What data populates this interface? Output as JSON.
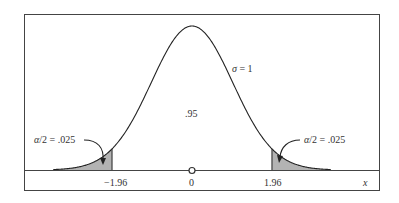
{
  "chart_data": {
    "type": "area",
    "title": "",
    "xlabel": "x",
    "ylabel": "",
    "x_ticks": [
      {
        "value": -1.96,
        "label": "−1.96"
      },
      {
        "value": 0,
        "label": "0"
      },
      {
        "value": 1.96,
        "label": "1.96"
      }
    ],
    "curve": {
      "mean": 0,
      "sigma": 1,
      "x_range": [
        -3.4,
        3.4
      ]
    },
    "shaded_regions": [
      {
        "from": -3.4,
        "to": -1.96,
        "area": 0.025,
        "label": "α/2 = .025"
      },
      {
        "from": 1.96,
        "to": 3.4,
        "area": 0.025,
        "label": "α/2 = .025"
      }
    ],
    "annotations": [
      {
        "text": "σ = 1",
        "position": "right of peak"
      },
      {
        "text": ".95",
        "position": "center under curve"
      },
      {
        "text": "α/2 = .025",
        "position": "left tail, arrow to shaded area"
      },
      {
        "text": "α/2 = .025",
        "position": "right tail, arrow to shaded area"
      }
    ],
    "grid": false,
    "legend": null
  },
  "labels": {
    "sigma": "σ = 1",
    "center_area": ".95",
    "left_tail": "α/2 = .025",
    "right_tail": "α/2 = .025",
    "tick_neg": "−1.96",
    "tick_zero": "0",
    "tick_pos": "1.96",
    "x_axis": "x"
  },
  "colors": {
    "curve": "#222222",
    "shade": "#b3b3b3",
    "frame": "#444444"
  }
}
